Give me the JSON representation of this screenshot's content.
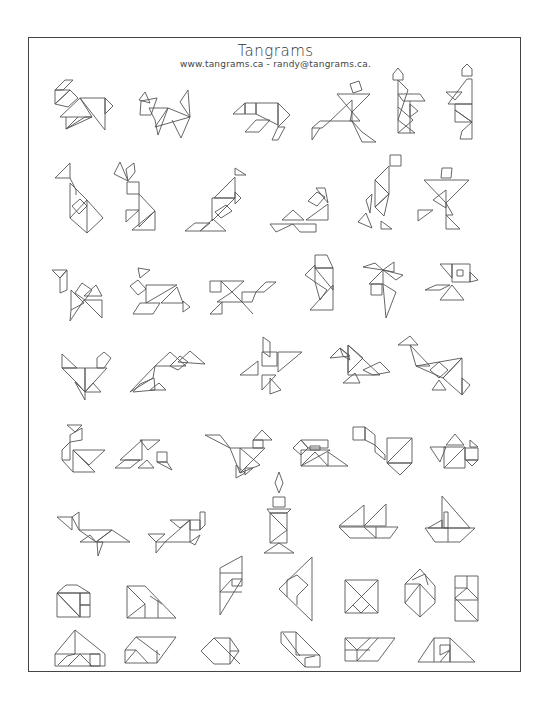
{
  "header": {
    "title": "Tangrams",
    "subtitle": "www.tangrams.ca - randy@tangrams.ca."
  },
  "colors": {
    "line": "#555555",
    "border": "#444444",
    "background": "#ffffff"
  },
  "grid": {
    "rows": 8,
    "figures_per_row": [
      6,
      6,
      6,
      5,
      6,
      5,
      6,
      6
    ],
    "total_figures": 46
  },
  "figures": [
    {
      "row": 1,
      "subject": "dog"
    },
    {
      "row": 1,
      "subject": "cat-fox"
    },
    {
      "row": 1,
      "subject": "bear"
    },
    {
      "row": 1,
      "subject": "running-man"
    },
    {
      "row": 1,
      "subject": "person-with-hat"
    },
    {
      "row": 1,
      "subject": "standing-person"
    },
    {
      "row": 2,
      "subject": "goose"
    },
    {
      "row": 2,
      "subject": "rabbit"
    },
    {
      "row": 2,
      "subject": "kneeling-bird"
    },
    {
      "row": 2,
      "subject": "sitting-person"
    },
    {
      "row": 2,
      "subject": "walking-person"
    },
    {
      "row": 2,
      "subject": "dancing-person"
    },
    {
      "row": 3,
      "subject": "camel"
    },
    {
      "row": 3,
      "subject": "deer"
    },
    {
      "row": 3,
      "subject": "horse"
    },
    {
      "row": 3,
      "subject": "figure-a"
    },
    {
      "row": 3,
      "subject": "pinwheel-figure"
    },
    {
      "row": 3,
      "subject": "fish"
    },
    {
      "row": 4,
      "subject": "hen"
    },
    {
      "row": 4,
      "subject": "flying-bird"
    },
    {
      "row": 4,
      "subject": "windmill-figure"
    },
    {
      "row": 4,
      "subject": "swimming-bird"
    },
    {
      "row": 4,
      "subject": "heron"
    },
    {
      "row": 5,
      "subject": "swan"
    },
    {
      "row": 5,
      "subject": "parrot"
    },
    {
      "row": 5,
      "subject": "duck"
    },
    {
      "row": 5,
      "subject": "house-boat"
    },
    {
      "row": 5,
      "subject": "pipe"
    },
    {
      "row": 5,
      "subject": "teapot"
    },
    {
      "row": 6,
      "subject": "whale"
    },
    {
      "row": 6,
      "subject": "fish-2"
    },
    {
      "row": 6,
      "subject": "candle"
    },
    {
      "row": 6,
      "subject": "sailboat"
    },
    {
      "row": 6,
      "subject": "sailboat-2"
    },
    {
      "row": 7,
      "subject": "house"
    },
    {
      "row": 7,
      "subject": "triangle-shape"
    },
    {
      "row": 7,
      "subject": "parallelogram-shape"
    },
    {
      "row": 7,
      "subject": "diamond-shape"
    },
    {
      "row": 7,
      "subject": "square"
    },
    {
      "row": 7,
      "subject": "hexagon"
    },
    {
      "row": 7,
      "subject": "rectangle"
    },
    {
      "row": 8,
      "subject": "trapezoid"
    },
    {
      "row": 8,
      "subject": "parallelogram"
    },
    {
      "row": 8,
      "subject": "hexagon-flat"
    },
    {
      "row": 8,
      "subject": "step-shape"
    },
    {
      "row": 8,
      "subject": "rectangle-wide"
    },
    {
      "row": 8,
      "subject": "trapezoid-2"
    }
  ]
}
